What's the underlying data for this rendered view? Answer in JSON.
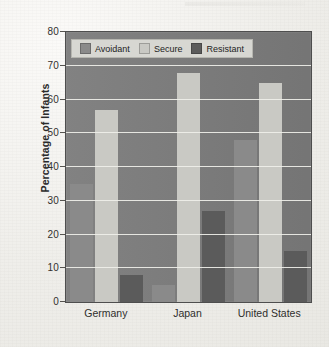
{
  "chart_data": {
    "type": "bar",
    "title": "",
    "xlabel": "",
    "ylabel": "Percentage of Infants",
    "ylim": [
      0,
      80
    ],
    "ytick_step": 10,
    "yticks": [
      0,
      10,
      20,
      30,
      40,
      50,
      60,
      70,
      80
    ],
    "grid": "horizontal",
    "legend_position": "top-left-inside",
    "categories": [
      "Germany",
      "Japan",
      "United States"
    ],
    "series": [
      {
        "name": "Avoidant",
        "color": "#8a8a8a",
        "values": [
          35,
          5,
          48
        ]
      },
      {
        "name": "Secure",
        "color": "#c9c9c4",
        "values": [
          57,
          68,
          65
        ]
      },
      {
        "name": "Resistant",
        "color": "#5b5b5b",
        "values": [
          8,
          27,
          15
        ]
      }
    ]
  },
  "colors": {
    "plot_background": "#7b7b7b",
    "gridline": "#efefe9",
    "page_background": "#efeeea",
    "legend_background": "#d7d7d2",
    "axis_text": "#2f2e2c"
  }
}
